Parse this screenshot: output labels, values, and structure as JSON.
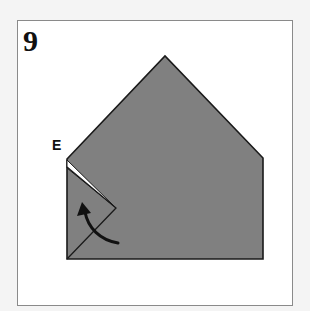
{
  "step": {
    "number": "9"
  },
  "labels": {
    "point_e": "E"
  },
  "colors": {
    "paper": "#808080",
    "outline": "#1a1a1a",
    "background": "#ffffff",
    "frame": "#8a8a8a"
  },
  "diagram": {
    "arrow": "curved arrow pointing up-left"
  }
}
